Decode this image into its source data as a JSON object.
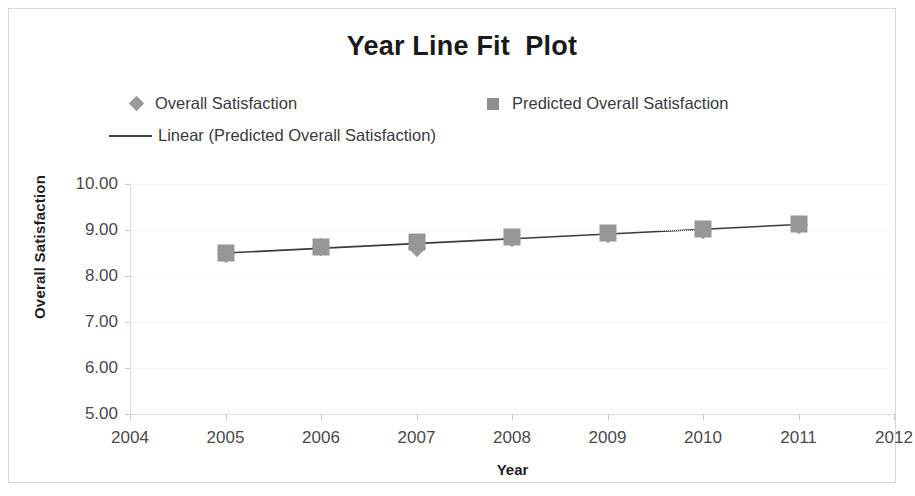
{
  "chart_data": {
    "type": "scatter",
    "title": "Year Line Fit  Plot",
    "xlabel": "Year",
    "ylabel": "Overall Satisfaction",
    "xlim": [
      2004,
      2012
    ],
    "ylim": [
      5.0,
      10.0
    ],
    "grid": true,
    "legend_position": "top",
    "x": [
      2005,
      2006,
      2007,
      2008,
      2009,
      2010,
      2011
    ],
    "xtick_labels": [
      "2004",
      "2005",
      "2006",
      "2007",
      "2008",
      "2009",
      "2010",
      "2011",
      "2012"
    ],
    "ytick_labels": [
      "5.00",
      "6.00",
      "7.00",
      "8.00",
      "9.00",
      "10.00"
    ],
    "ytick_values": [
      5.0,
      6.0,
      7.0,
      8.0,
      9.0,
      10.0
    ],
    "series": [
      {
        "name": "Overall Satisfaction",
        "marker": "diamond",
        "color": "#9c9c9c",
        "values": [
          8.48,
          8.62,
          8.6,
          8.82,
          8.92,
          9.0,
          9.1
        ]
      },
      {
        "name": "Predicted Overall Satisfaction",
        "marker": "square",
        "color": "#969696",
        "values": [
          8.5,
          8.63,
          8.75,
          8.85,
          8.93,
          9.02,
          9.12
        ]
      }
    ],
    "trendline": {
      "name": "Linear (Predicted Overall Satisfaction)",
      "color": "#3a3a3a",
      "x": [
        2005,
        2011
      ],
      "y": [
        8.5,
        9.12
      ]
    }
  },
  "legend": {
    "items": [
      {
        "label": "Overall Satisfaction",
        "marker": "diamond-marker-icon"
      },
      {
        "label": "Predicted Overall Satisfaction",
        "marker": "square-marker-icon"
      },
      {
        "label": "Linear (Predicted Overall Satisfaction)",
        "marker": "line-marker-icon"
      }
    ]
  }
}
